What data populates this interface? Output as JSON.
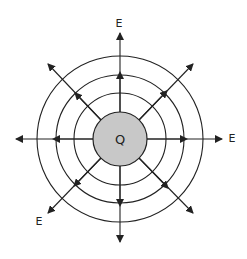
{
  "diagram": {
    "charge_label": "Q",
    "field_labels": [
      "E",
      "E",
      "E"
    ],
    "colors": {
      "line": "#222222",
      "charge_fill": "#c8c8c8",
      "background": "#ffffff"
    },
    "center": [
      120,
      139
    ],
    "charge_radius": 27,
    "equipotential_radii": [
      46,
      64,
      83
    ],
    "field_line_count": 8
  }
}
